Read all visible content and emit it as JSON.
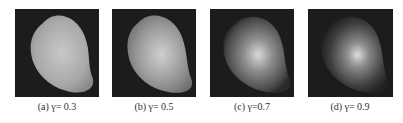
{
  "figure": {
    "panels": [
      {
        "label": "(a)",
        "symbol": "γ",
        "value": "= 0.3",
        "caption": "(a) γ= 0.3"
      },
      {
        "label": "(b)",
        "symbol": "γ",
        "value": "= 0.5",
        "caption": "(b) γ= 0.5"
      },
      {
        "label": "(c)",
        "symbol": "γ",
        "value": "=0.7",
        "caption": "(c) γ=0.7"
      },
      {
        "label": "(d)",
        "symbol": "γ",
        "value": "= 0.9",
        "caption": "(d) γ= 0.9"
      }
    ]
  }
}
